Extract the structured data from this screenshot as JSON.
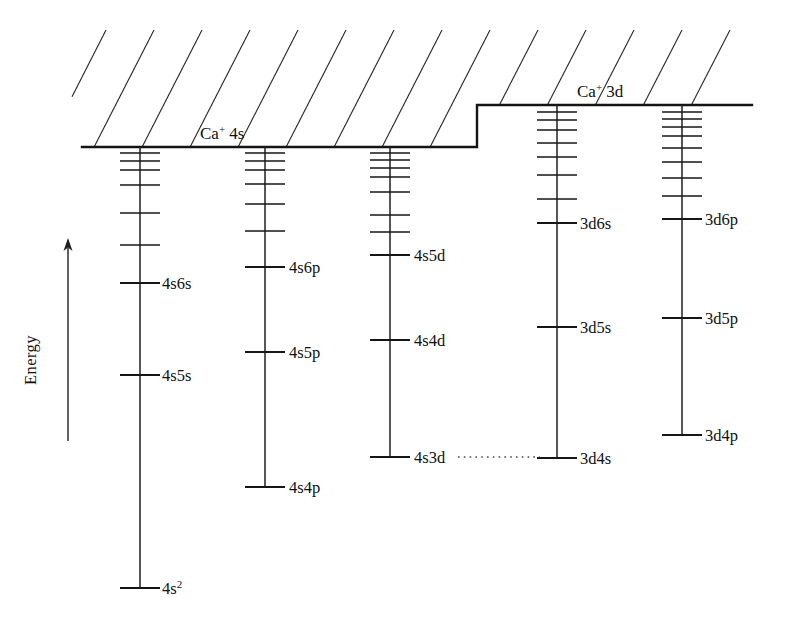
{
  "figure": {
    "width": 789,
    "height": 623,
    "background": "#ffffff",
    "ink_color": "#141414"
  },
  "axis": {
    "label": "Energy",
    "direction": "up",
    "x": 68,
    "y_bottom": 441,
    "y_top": 238,
    "label_x": 36,
    "label_y": 360
  },
  "continuum": {
    "hatch_angle_deg": 63,
    "hatch_spacing": 48,
    "description": "hatched ionization continuum above the limits"
  },
  "limits": [
    {
      "name": "Ca+ 4s",
      "label_core": "Ca",
      "label_charge": "+",
      "label_term": "4s",
      "label_x": 200,
      "label_y": 139,
      "y": 147,
      "x_start": 82,
      "x_end": 477
    },
    {
      "name": "Ca+ 3d",
      "label_core": "Ca",
      "label_charge": "+",
      "label_term": "3d",
      "label_x": 577,
      "label_y": 97,
      "y": 105,
      "x_start": 477,
      "x_end": 752
    }
  ],
  "connector": {
    "name": "4s3d-to-3d4s",
    "x_start": 458,
    "x_end": 540,
    "y": 457
  },
  "chart_data": {
    "type": "line",
    "xlabel": "",
    "ylabel": "Energy",
    "ylim": [
      623,
      100
    ],
    "grid": false,
    "legend": "none",
    "note": "Level positions given as pixel y-coordinates; lower y = higher energy",
    "series": [
      {
        "name": "4sns singlet/triplet series",
        "column": 1,
        "spine_x": 140,
        "limit": "Ca+ 4s",
        "label_x": 162,
        "tick_half_width": 20,
        "spine_top": 147,
        "spine_bottom": 588,
        "levels": [
          {
            "label": "",
            "y": 153,
            "labeled": false
          },
          {
            "label": "",
            "y": 161,
            "labeled": false
          },
          {
            "label": "",
            "y": 170,
            "labeled": false
          },
          {
            "label": "",
            "y": 185,
            "labeled": false
          },
          {
            "label": "",
            "y": 213,
            "labeled": false
          },
          {
            "label": "",
            "y": 245,
            "labeled": false
          },
          {
            "label": "4s6s",
            "y": 283,
            "labeled": true
          },
          {
            "label": "4s5s",
            "y": 375,
            "labeled": true
          },
          {
            "label": "4s2",
            "y": 588,
            "labeled": true,
            "superscript": "2",
            "base": "4s"
          }
        ]
      },
      {
        "name": "4snp series",
        "column": 2,
        "spine_x": 265,
        "limit": "Ca+ 4s",
        "label_x": 289,
        "tick_half_width": 20,
        "spine_top": 147,
        "spine_bottom": 487,
        "levels": [
          {
            "label": "",
            "y": 153,
            "labeled": false
          },
          {
            "label": "",
            "y": 161,
            "labeled": false
          },
          {
            "label": "",
            "y": 170,
            "labeled": false
          },
          {
            "label": "",
            "y": 184,
            "labeled": false
          },
          {
            "label": "",
            "y": 204,
            "labeled": false
          },
          {
            "label": "",
            "y": 231,
            "labeled": false
          },
          {
            "label": "4s6p",
            "y": 267,
            "labeled": true
          },
          {
            "label": "4s5p",
            "y": 352,
            "labeled": true
          },
          {
            "label": "4s4p",
            "y": 487,
            "labeled": true
          }
        ]
      },
      {
        "name": "4snd series",
        "column": 3,
        "spine_x": 390,
        "limit": "Ca+ 4s",
        "label_x": 414,
        "tick_half_width": 20,
        "spine_top": 147,
        "spine_bottom": 457,
        "levels": [
          {
            "label": "",
            "y": 153,
            "labeled": false
          },
          {
            "label": "",
            "y": 160,
            "labeled": false
          },
          {
            "label": "",
            "y": 168,
            "labeled": false
          },
          {
            "label": "",
            "y": 177,
            "labeled": false
          },
          {
            "label": "",
            "y": 192,
            "labeled": false
          },
          {
            "label": "",
            "y": 215,
            "labeled": false
          },
          {
            "label": "",
            "y": 232,
            "labeled": false
          },
          {
            "label": "4s5d",
            "y": 255,
            "labeled": true
          },
          {
            "label": "4s4d",
            "y": 340,
            "labeled": true
          },
          {
            "label": "4s3d",
            "y": 457,
            "labeled": true
          }
        ]
      },
      {
        "name": "3dns series",
        "column": 4,
        "spine_x": 557,
        "limit": "Ca+ 3d",
        "label_x": 580,
        "tick_half_width": 20,
        "spine_top": 105,
        "spine_bottom": 458,
        "levels": [
          {
            "label": "",
            "y": 112,
            "labeled": false
          },
          {
            "label": "",
            "y": 120,
            "labeled": false
          },
          {
            "label": "",
            "y": 130,
            "labeled": false
          },
          {
            "label": "",
            "y": 143,
            "labeled": false
          },
          {
            "label": "",
            "y": 157,
            "labeled": false
          },
          {
            "label": "",
            "y": 175,
            "labeled": false
          },
          {
            "label": "",
            "y": 199,
            "labeled": false
          },
          {
            "label": "3d6s",
            "y": 223,
            "labeled": true
          },
          {
            "label": "3d5s",
            "y": 327,
            "labeled": true
          },
          {
            "label": "3d4s",
            "y": 458,
            "labeled": true
          }
        ]
      },
      {
        "name": "3dnp series",
        "column": 5,
        "spine_x": 682,
        "limit": "Ca+ 3d",
        "label_x": 705,
        "tick_half_width": 20,
        "spine_top": 105,
        "spine_bottom": 435,
        "levels": [
          {
            "label": "",
            "y": 112,
            "labeled": false
          },
          {
            "label": "",
            "y": 119,
            "labeled": false
          },
          {
            "label": "",
            "y": 127,
            "labeled": false
          },
          {
            "label": "",
            "y": 136,
            "labeled": false
          },
          {
            "label": "",
            "y": 148,
            "labeled": false
          },
          {
            "label": "",
            "y": 162,
            "labeled": false
          },
          {
            "label": "",
            "y": 178,
            "labeled": false
          },
          {
            "label": "",
            "y": 196,
            "labeled": false
          },
          {
            "label": "3d6p",
            "y": 219,
            "labeled": true
          },
          {
            "label": "3d5p",
            "y": 318,
            "labeled": true
          },
          {
            "label": "3d4p",
            "y": 435,
            "labeled": true
          }
        ]
      }
    ]
  }
}
